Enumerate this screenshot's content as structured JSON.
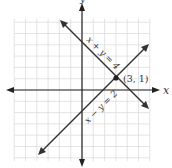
{
  "diagram": {
    "type": "coordinate-plane-system-of-equations",
    "axes": {
      "x_label": "x",
      "y_label": "y",
      "xlim": [
        -6,
        6
      ],
      "ylim": [
        -6,
        6
      ],
      "grid": true
    },
    "lines": [
      {
        "equation": "x + y = 4",
        "label": "x + y = 4",
        "color": "#333333"
      },
      {
        "equation": "x − y = 2",
        "label": "x − y = 2",
        "color": "#333333"
      }
    ],
    "intersection": {
      "label": "(3, 1)",
      "x": 3,
      "y": 1
    },
    "colors": {
      "grid": "#d8d8d8",
      "axis": "#222222",
      "line": "#333333"
    }
  }
}
